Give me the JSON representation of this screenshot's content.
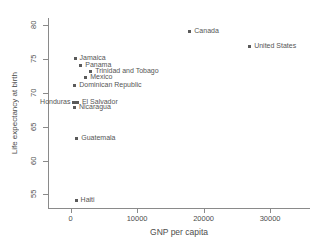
{
  "chart_data": {
    "type": "scatter",
    "title": "",
    "xlabel": "GNP per capita",
    "ylabel": "Life expectancy at birth",
    "xlim": [
      -3400,
      36000
    ],
    "ylim": [
      53.0,
      81.0
    ],
    "grid": false,
    "legend": null,
    "xticks": [
      0,
      10000,
      20000,
      30000
    ],
    "xtick_labels": [
      "0",
      "10000",
      "20000",
      "30000"
    ],
    "yticks": [
      55,
      60,
      65,
      70,
      75,
      80
    ],
    "ytick_labels": [
      "55",
      "60",
      "65",
      "70",
      "75",
      "80"
    ],
    "marker_color": "#5a5a5a",
    "points": [
      {
        "label": "Canada",
        "x": 18000,
        "y": 79.0,
        "label_side": "right"
      },
      {
        "label": "United States",
        "x": 27000,
        "y": 76.8,
        "label_side": "right"
      },
      {
        "label": "Jamaica",
        "x": 750,
        "y": 75.0,
        "label_side": "right"
      },
      {
        "label": "Panama",
        "x": 1600,
        "y": 74.0,
        "label_side": "right"
      },
      {
        "label": "Trinidad and Tobago",
        "x": 3100,
        "y": 73.0,
        "label_side": "right"
      },
      {
        "label": "Mexico",
        "x": 2350,
        "y": 72.2,
        "label_side": "right"
      },
      {
        "label": "Dominican Republic",
        "x": 700,
        "y": 71.0,
        "label_side": "right"
      },
      {
        "label": "Honduras",
        "x": 580,
        "y": 68.5,
        "label_side": "left"
      },
      {
        "label": "El Salvador",
        "x": 1100,
        "y": 68.5,
        "label_side": "right"
      },
      {
        "label": "Nicaragua",
        "x": 650,
        "y": 67.7,
        "label_side": "right"
      },
      {
        "label": "Guatemala",
        "x": 1000,
        "y": 63.2,
        "label_side": "right"
      },
      {
        "label": "Haiti",
        "x": 900,
        "y": 54.0,
        "label_side": "right"
      }
    ]
  }
}
